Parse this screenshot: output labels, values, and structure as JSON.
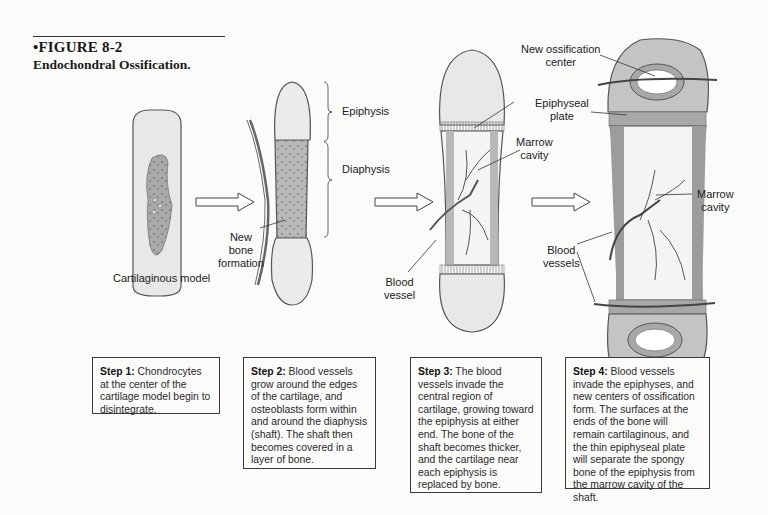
{
  "figure": {
    "number": "•FIGURE 8-2",
    "title": "Endochondral Ossification."
  },
  "labels": {
    "cartilaginous_model": "Cartilaginous model",
    "new_bone_formation": [
      "New",
      "bone",
      "formation"
    ],
    "epiphysis": "Epiphysis",
    "diaphysis": "Diaphysis",
    "blood_vessel": [
      "Blood",
      "vessel"
    ],
    "marrow_cavity_3": [
      "Marrow",
      "cavity"
    ],
    "new_ossification_center": [
      "New ossification",
      "center"
    ],
    "epiphyseal_plate": [
      "Epiphyseal",
      "plate"
    ],
    "marrow_cavity_4": [
      "Marrow",
      "cavity"
    ],
    "blood_vessels": [
      "Blood",
      "vessels"
    ]
  },
  "steps": [
    {
      "heading": "Step 1:",
      "text": " Chondrocytes at the center of the cartilage model begin to disintegrate."
    },
    {
      "heading": "Step 2:",
      "text": " Blood vessels grow around the edges of the cartilage, and osteoblasts form within and around the diaphysis (shaft). The shaft then becomes covered in a layer of bone."
    },
    {
      "heading": "Step 3:",
      "text": " The blood vessels invade the central region of cartilage, growing toward the epiphysis at either end. The bone of the shaft becomes thicker, and the cartilage near each epiphysis is replaced by bone."
    },
    {
      "heading": "Step 4:",
      "text": " Blood vessels invade the epiphyses, and new centers of ossification form. The surfaces at the ends of the bone will remain cartilaginous, and the thin epiphyseal plate will separate the spongy bone of the epiphysis from the marrow cavity of the shaft."
    }
  ],
  "colors": {
    "cartilage": "#e6e6e4",
    "bone_gray": "#b4b4b2",
    "dark_bone": "#9a9a98",
    "outline": "#4a4a4a"
  }
}
